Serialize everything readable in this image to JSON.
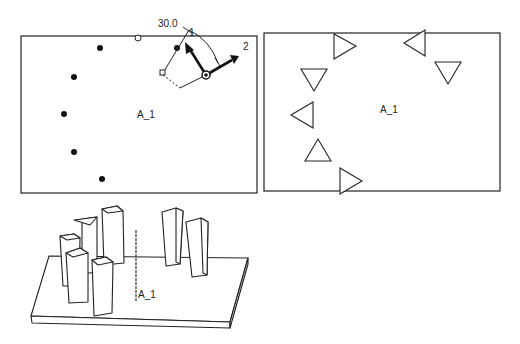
{
  "left_view": {
    "label": "A_1",
    "angle_label": "30.0",
    "axis_label_1": "1",
    "axis_label_2": "2",
    "dots": [
      [
        100,
        48
      ],
      [
        74,
        77
      ],
      [
        64,
        114
      ],
      [
        74,
        152
      ],
      [
        102,
        179
      ],
      [
        178,
        47
      ]
    ],
    "open_circle": [
      138,
      38
    ]
  },
  "right_view": {
    "label": "A_1",
    "triangles": [
      {
        "dir": "right",
        "cx": 342,
        "cy": 46
      },
      {
        "dir": "left",
        "cx": 415,
        "cy": 43
      },
      {
        "dir": "down",
        "cx": 313,
        "cy": 79
      },
      {
        "dir": "down",
        "cx": 448,
        "cy": 71
      },
      {
        "dir": "left",
        "cx": 298,
        "cy": 115
      },
      {
        "dir": "up",
        "cx": 318,
        "cy": 150
      },
      {
        "dir": "right",
        "cx": 349,
        "cy": 181
      }
    ]
  },
  "iso_view": {
    "label": "A_1"
  },
  "colors": {
    "line": "#222222",
    "background": "#ffffff"
  }
}
